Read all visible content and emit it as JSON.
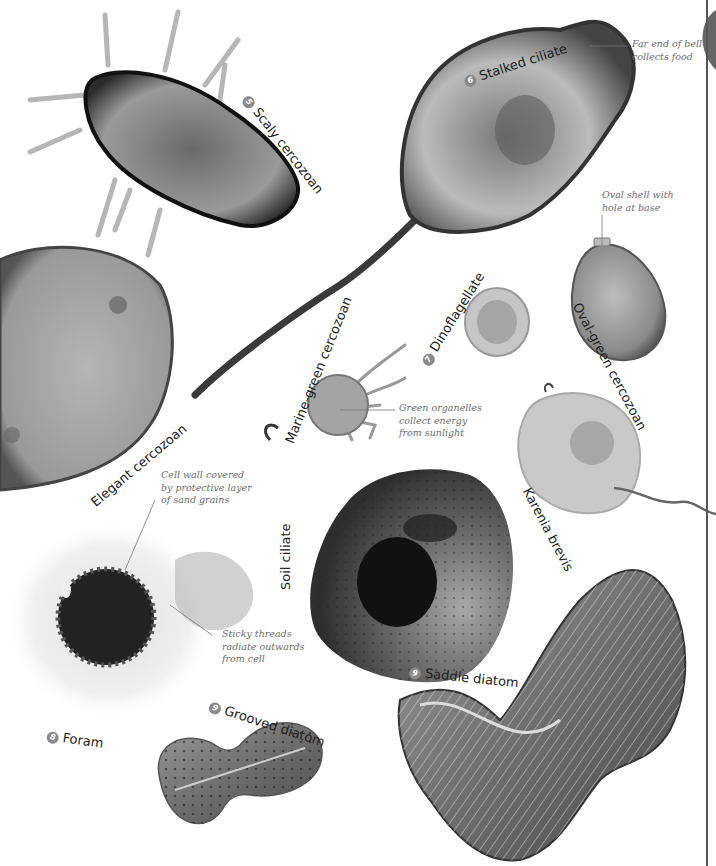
{
  "organisms": [
    {
      "number": "5",
      "name": "Scaly cercozoan"
    },
    {
      "number": "6",
      "name": "Stalked ciliate"
    },
    {
      "number": "7",
      "name": "Dinoflagellate"
    },
    {
      "name": "Oval-green cercozoan"
    },
    {
      "name": "Elegant cercozoan"
    },
    {
      "name": "Marine-green cercozoan"
    },
    {
      "name": "Karenia brevis"
    },
    {
      "name": "Soil ciliate"
    },
    {
      "number": "8",
      "name": "Foram"
    },
    {
      "number": "9",
      "name": "Grooved diatom"
    },
    {
      "number": "9",
      "name": "Saddle diatom"
    }
  ],
  "annotations": {
    "stalked_ciliate": [
      "Far end of bell",
      "collects food"
    ],
    "oval_green": [
      "Oval shell with",
      "hole at base"
    ],
    "marine_green": [
      "Green organelles",
      "collect energy",
      "from sunlight"
    ],
    "foram_wall": [
      "Cell wall covered",
      "by protective layer",
      "of sand grains"
    ],
    "foram_threads": [
      "Sticky threads",
      "radiate outwards",
      "from cell"
    ]
  },
  "colors": {
    "label_text": "#222222",
    "annotation_text": "#6b6b6b",
    "number_badge": "#8a8a8a",
    "page_rule": "#555555"
  }
}
